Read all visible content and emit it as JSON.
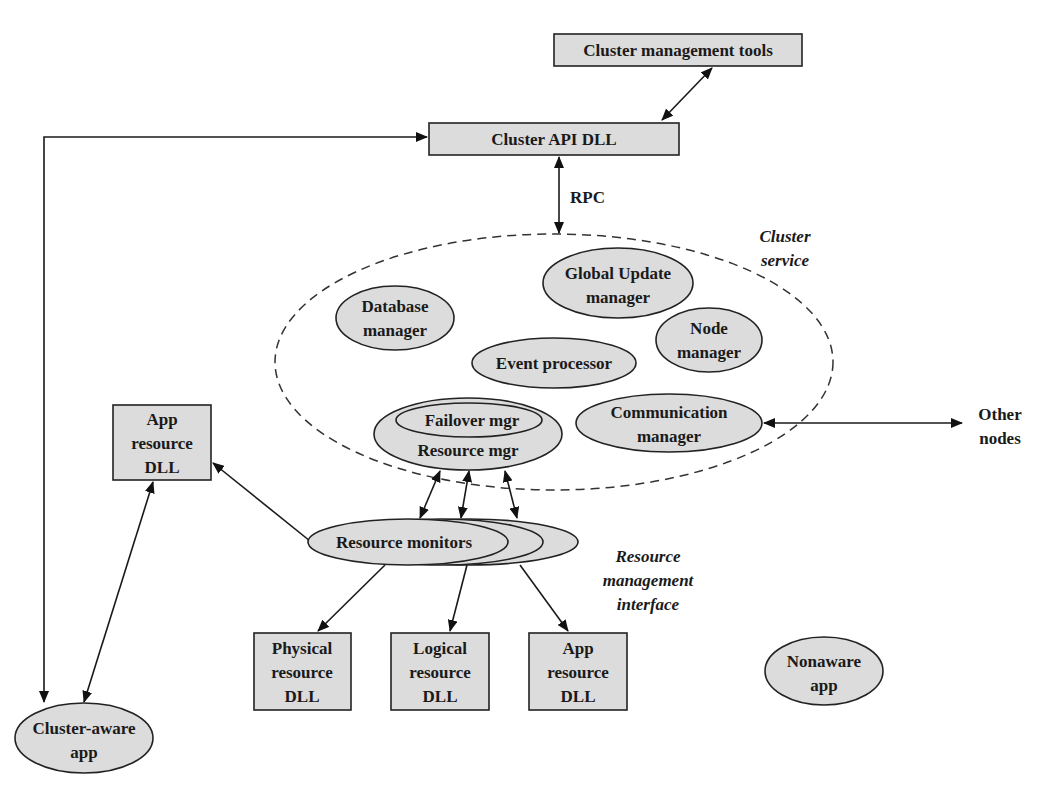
{
  "diagram": {
    "boxes": {
      "cluster_mgmt_tools": "Cluster management tools",
      "cluster_api_dll": "Cluster API DLL",
      "app_resource_dll_left": [
        "App",
        "resource",
        "DLL"
      ],
      "physical_resource_dll": [
        "Physical",
        "resource",
        "DLL"
      ],
      "logical_resource_dll": [
        "Logical",
        "resource",
        "DLL"
      ],
      "app_resource_dll_bottom": [
        "App",
        "resource",
        "DLL"
      ]
    },
    "ellipses": {
      "global_update_manager": [
        "Global Update",
        "manager"
      ],
      "database_manager": [
        "Database",
        "manager"
      ],
      "node_manager": [
        "Node",
        "manager"
      ],
      "event_processor": "Event processor",
      "failover_mgr": "Failover mgr",
      "resource_mgr": "Resource mgr",
      "communication_manager": [
        "Communication",
        "manager"
      ],
      "resource_monitors": "Resource monitors",
      "cluster_aware_app": [
        "Cluster-aware",
        "app"
      ],
      "nonaware_app": [
        "Nonaware",
        "app"
      ]
    },
    "labels": {
      "rpc": "RPC",
      "cluster_service": [
        "Cluster",
        "service"
      ],
      "other_nodes": [
        "Other",
        "nodes"
      ],
      "resource_mgmt_interface": [
        "Resource",
        "management",
        "interface"
      ]
    }
  }
}
